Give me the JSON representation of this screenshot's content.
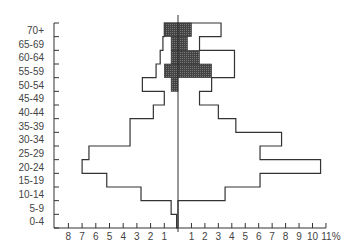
{
  "chart_data": {
    "type": "bar",
    "subtype": "population-pyramid",
    "title": "",
    "xlabel": "%",
    "ylabel": "",
    "categories": [
      "0-4",
      "5-9",
      "10-14",
      "15-19",
      "20-24",
      "25-29",
      "30-34",
      "35-39",
      "40-44",
      "45-49",
      "50-54",
      "55-59",
      "60-64",
      "65-69",
      "70+"
    ],
    "series": [
      {
        "name": "Left total (outline)",
        "side": "left",
        "style": "outline",
        "values": [
          0.1,
          0.5,
          2.7,
          5.2,
          7.0,
          6.5,
          3.5,
          3.5,
          1.8,
          1.0,
          2.6,
          1.6,
          1.3,
          1.1,
          1.0
        ]
      },
      {
        "name": "Right total (outline)",
        "side": "right",
        "style": "outline",
        "values": [
          0.0,
          0.0,
          3.5,
          6.1,
          10.6,
          6.1,
          7.7,
          4.3,
          3.0,
          1.6,
          2.5,
          4.2,
          4.2,
          1.6,
          3.2
        ]
      },
      {
        "name": "Left subgroup (shaded)",
        "side": "left",
        "style": "shaded",
        "values": [
          0,
          0,
          0,
          0,
          0,
          0,
          0,
          0,
          0,
          0,
          0.5,
          1.0,
          0.5,
          0.5,
          1.0
        ]
      },
      {
        "name": "Right subgroup (shaded)",
        "side": "right",
        "style": "shaded",
        "values": [
          0,
          0,
          0,
          0,
          0,
          0,
          0,
          0,
          0,
          0,
          0,
          2.5,
          1.6,
          0.7,
          1.0
        ]
      }
    ],
    "x_left_ticks": [
      "8",
      "7",
      "6",
      "5",
      "4",
      "3",
      "2",
      "1"
    ],
    "x_right_ticks": [
      "1",
      "2",
      "3",
      "4",
      "5",
      "6",
      "7",
      "8",
      "9",
      "10",
      "11%"
    ],
    "xlim_left": [
      0,
      8.5
    ],
    "xlim_right": [
      0,
      11
    ],
    "grid": false,
    "legend": "none",
    "colors": {
      "outline": "#333333",
      "shaded": "#555555",
      "axis": "#333333"
    }
  }
}
